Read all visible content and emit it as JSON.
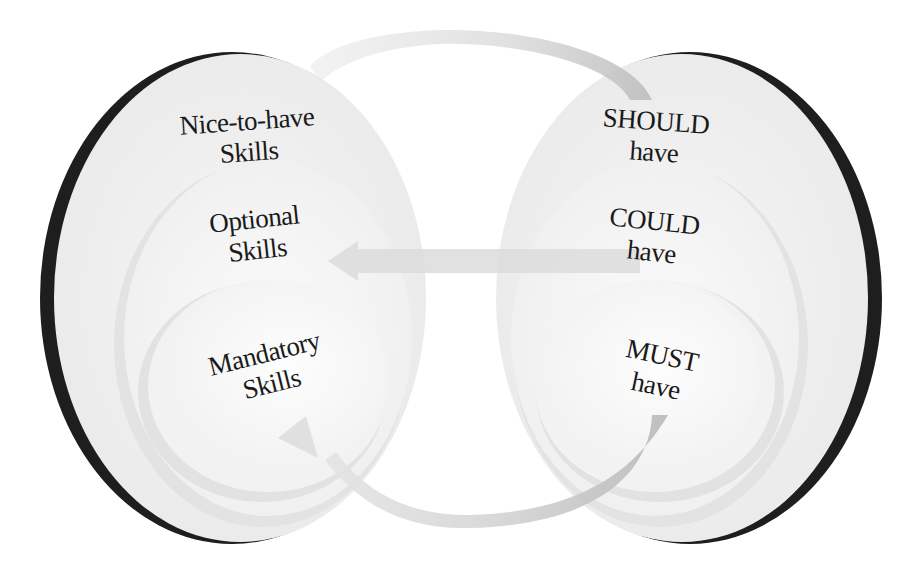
{
  "diagram": {
    "title": "",
    "colors": {
      "background": "#ffffff",
      "outer_fill": "#eeeeee",
      "middle_fill": "#f4f4f4",
      "inner_fill": "#f8f8f8",
      "outline": "#1e1e1e",
      "arrow_fill": "#d8d8d8",
      "arrow_dark": "#c0c0c0",
      "text": "#1a1a1a"
    },
    "left_group": {
      "name": "Skills",
      "layers": [
        {
          "id": "outer",
          "line1": "Nice-to-have",
          "line2": "Skills"
        },
        {
          "id": "middle",
          "line1": "Optional",
          "line2": "Skills"
        },
        {
          "id": "inner",
          "line1": "Mandatory",
          "line2": "Skills"
        }
      ]
    },
    "right_group": {
      "name": "MoSCoW",
      "layers": [
        {
          "id": "outer",
          "line1": "SHOULD",
          "line2": "have"
        },
        {
          "id": "middle",
          "line1": "COULD",
          "line2": "have"
        },
        {
          "id": "inner",
          "line1": "MUST",
          "line2": "have"
        }
      ]
    },
    "arrows": [
      {
        "id": "top-arc",
        "from": "SHOULD have",
        "to": "Nice-to-have Skills",
        "direction": "right-to-left",
        "shape": "arc-over-top"
      },
      {
        "id": "middle-straight",
        "from": "COULD have",
        "to": "Optional Skills",
        "direction": "right-to-left",
        "shape": "straight"
      },
      {
        "id": "bottom-arc",
        "from": "MUST have",
        "to": "Mandatory Skills",
        "direction": "right-to-left",
        "shape": "arc-under-bottom"
      }
    ]
  }
}
